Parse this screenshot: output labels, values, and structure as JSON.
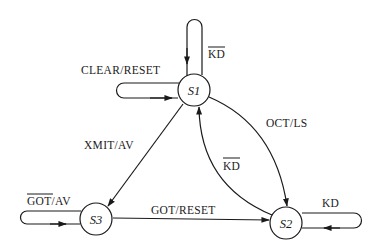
{
  "diagram": {
    "type": "state-machine",
    "states": [
      {
        "id": "S1",
        "label": "S1"
      },
      {
        "id": "S2",
        "label": "S2"
      },
      {
        "id": "S3",
        "label": "S3"
      }
    ],
    "transitions": [
      {
        "from": "S1",
        "to": "S1",
        "label": "KD",
        "overline": "KD",
        "position": "top"
      },
      {
        "from": "S1",
        "to": "S1",
        "label": "CLEAR/RESET",
        "position": "left"
      },
      {
        "from": "S1",
        "to": "S2",
        "label": "OCT/LS"
      },
      {
        "from": "S2",
        "to": "S1",
        "label": "KD",
        "overline": "KD"
      },
      {
        "from": "S1",
        "to": "S3",
        "label": "XMIT/AV"
      },
      {
        "from": "S3",
        "to": "S3",
        "label": "GOT/AV",
        "overline": "GOT",
        "position": "left"
      },
      {
        "from": "S3",
        "to": "S2",
        "label": "GOT/RESET"
      },
      {
        "from": "S2",
        "to": "S2",
        "label": "KD",
        "position": "right"
      }
    ]
  },
  "labels": {
    "s1": "S1",
    "s2": "S2",
    "s3": "S3",
    "s1_self_top": "KD",
    "s1_self_left": "CLEAR/RESET",
    "s1_to_s2": "OCT/LS",
    "s2_to_s1": "KD",
    "s1_to_s3": "XMIT/AV",
    "s3_self_got": "GOT",
    "s3_self_rest": "/AV",
    "s3_to_s2": "GOT/RESET",
    "s2_self": "KD"
  }
}
